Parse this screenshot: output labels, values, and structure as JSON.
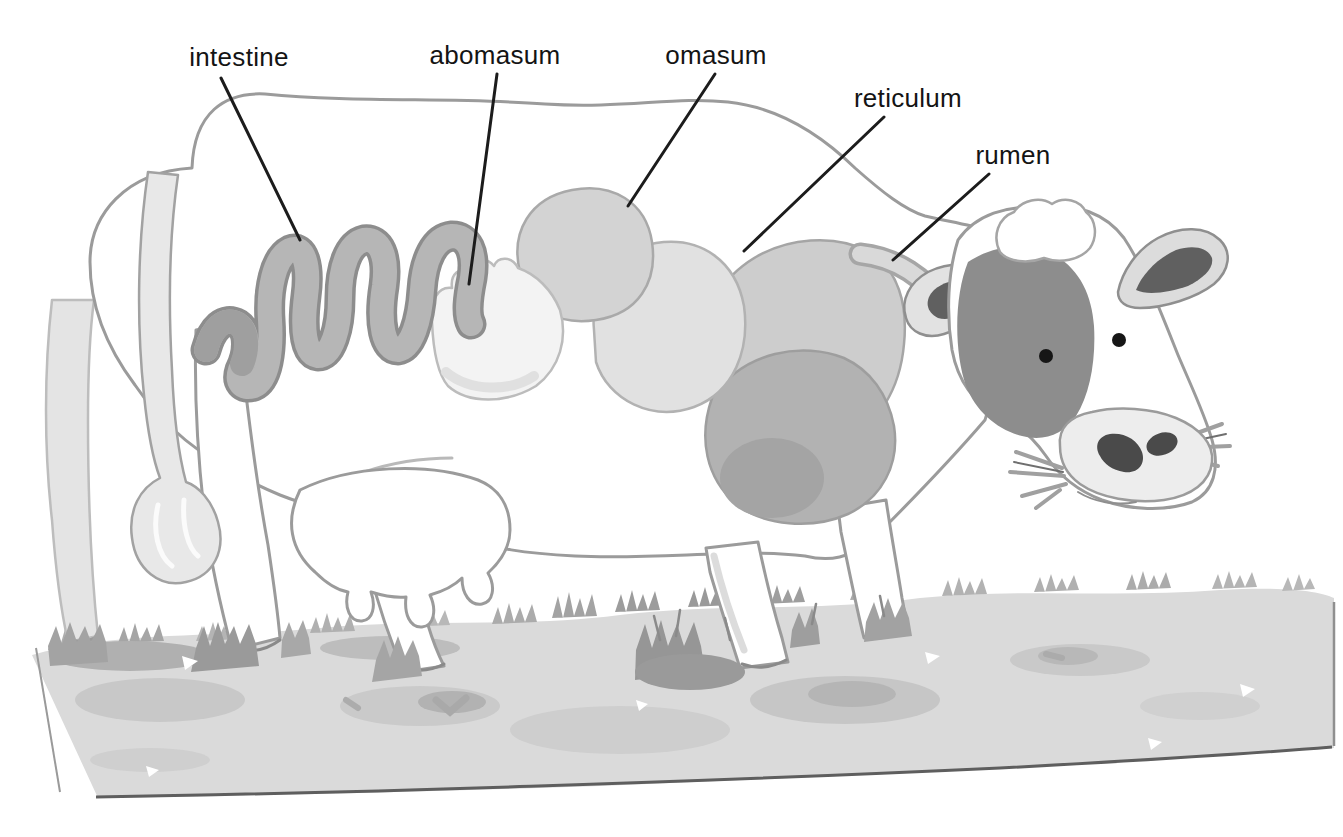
{
  "labels": [
    {
      "text": "intestine"
    },
    {
      "text": "abomasum"
    },
    {
      "text": "omasum"
    },
    {
      "text": "reticulum"
    },
    {
      "text": "rumen"
    }
  ],
  "colors": {
    "label_text": "#141414",
    "leader_line": "#1c1c1c",
    "outline": "#9b9b9b",
    "body_fill": "#ffffff",
    "face_patch": "#8d8d8d",
    "ear_inner": "#606060",
    "eye": "#161616",
    "nostril": "#4a4a4a",
    "muzzle_fill": "#ededed",
    "intestine_tube": "#b6b6b6",
    "intestine_edge": "#8d8d8d",
    "abomasum_fill": "#f3f3f3",
    "omasum_fill": "#d3d3d3",
    "reticulum_fill": "#e1e1e1",
    "rumen_upper_fill": "#cdcdcd",
    "rumen_lower_fill": "#b2b2b2",
    "tail_fill": "#e8e8e8",
    "grass_fill": "#dadada",
    "grass_dark": "#9a9a9a"
  }
}
